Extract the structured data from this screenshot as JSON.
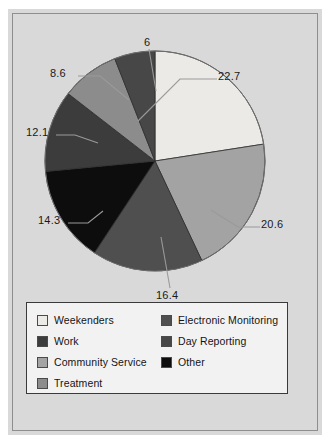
{
  "chart_data": {
    "type": "pie",
    "title": "",
    "subtitle": "",
    "xlabel": "",
    "ylabel": "",
    "legend_position": "bottom",
    "grid": false,
    "start_angle_deg": 0,
    "direction": "clockwise",
    "categories": [
      "Weekenders",
      "Community Service",
      "Electronic Monitoring",
      "Other",
      "Work",
      "Treatment",
      "Day Reporting"
    ],
    "values": [
      22.7,
      20.6,
      16.4,
      14.3,
      12.1,
      8.6,
      6
    ],
    "value_labels": [
      "22.7",
      "20.6",
      "16.4",
      "14.3",
      "12.1",
      "8.6",
      "6"
    ],
    "colors": [
      "#eceae6",
      "#a3a3a3",
      "#4f4f4f",
      "#0d0d0d",
      "#3c3c3c",
      "#8c8c8c",
      "#474747"
    ],
    "slices": [
      {
        "label": "Weekenders",
        "value": 22.7,
        "value_label": "22.7",
        "color": "#eceae6"
      },
      {
        "label": "Community Service",
        "value": 20.6,
        "value_label": "20.6",
        "color": "#a3a3a3"
      },
      {
        "label": "Electronic Monitoring",
        "value": 16.4,
        "value_label": "16.4",
        "color": "#4f4f4f"
      },
      {
        "label": "Other",
        "value": 14.3,
        "value_label": "14.3",
        "color": "#0d0d0d"
      },
      {
        "label": "Work",
        "value": 12.1,
        "value_label": "12.1",
        "color": "#3c3c3c"
      },
      {
        "label": "Treatment",
        "value": 8.6,
        "value_label": "8.6",
        "color": "#8c8c8c"
      },
      {
        "label": "Day Reporting",
        "value": 6,
        "value_label": "6",
        "color": "#474747"
      }
    ]
  },
  "value_labels": {
    "v1": "22.7",
    "v2": "20.6",
    "v3": "16.4",
    "v4": "14.3",
    "v5": "12.1",
    "v6": "8.6",
    "v7": "6"
  },
  "legend": {
    "left_column": [
      {
        "label": "Weekenders",
        "color": "#eceae6"
      },
      {
        "label": "Work",
        "color": "#3c3c3c"
      },
      {
        "label": "Community Service",
        "color": "#a3a3a3"
      },
      {
        "label": "Treatment",
        "color": "#8c8c8c"
      }
    ],
    "right_column": [
      {
        "label": "Electronic Monitoring",
        "color": "#4f4f4f"
      },
      {
        "label": "Day Reporting",
        "color": "#474747"
      },
      {
        "label": "Other",
        "color": "#0d0d0d"
      }
    ]
  }
}
